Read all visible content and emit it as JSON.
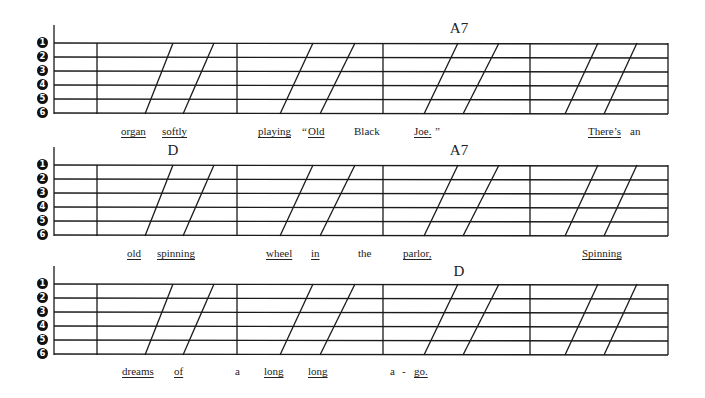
{
  "page": {
    "string_numbers": [
      "1",
      "2",
      "3",
      "4",
      "5",
      "6"
    ],
    "systems": [
      {
        "id": "system-1",
        "top": 0,
        "chords": [
          {
            "label": "A7",
            "x": 459,
            "y": 20
          }
        ],
        "lyrics": [
          {
            "text": "organ",
            "x": 121,
            "y": 125,
            "underline": true
          },
          {
            "text": "softly",
            "x": 162,
            "y": 125,
            "underline": true
          },
          {
            "text": "playing",
            "x": 258,
            "y": 125,
            "underline": true
          },
          {
            "text": "“",
            "x": 302,
            "y": 125,
            "underline": false
          },
          {
            "text": "Old",
            "x": 308,
            "y": 125,
            "underline": true
          },
          {
            "text": "Black",
            "x": 354,
            "y": 125,
            "underline": false
          },
          {
            "text": "Joe.",
            "x": 414,
            "y": 125,
            "underline": true
          },
          {
            "text": "”",
            "x": 435,
            "y": 125,
            "underline": false
          },
          {
            "text": "There’s",
            "x": 588,
            "y": 125,
            "underline": true
          },
          {
            "text": "an",
            "x": 630,
            "y": 125,
            "underline": false
          }
        ]
      },
      {
        "id": "system-2",
        "top": 122,
        "chords": [
          {
            "label": "D",
            "x": 173,
            "y": 20
          },
          {
            "label": "A7",
            "x": 459,
            "y": 20
          }
        ],
        "lyrics": [
          {
            "text": "old",
            "x": 127,
            "y": 125,
            "underline": true
          },
          {
            "text": "spinning",
            "x": 157,
            "y": 125,
            "underline": true
          },
          {
            "text": "wheel",
            "x": 266,
            "y": 125,
            "underline": true
          },
          {
            "text": "in",
            "x": 311,
            "y": 125,
            "underline": true
          },
          {
            "text": "the",
            "x": 358,
            "y": 125,
            "underline": false
          },
          {
            "text": "parlor,",
            "x": 403,
            "y": 125,
            "underline": true
          },
          {
            "text": "Spinning",
            "x": 582,
            "y": 125,
            "underline": true
          }
        ]
      },
      {
        "id": "system-3",
        "top": 241,
        "chords": [
          {
            "label": "D",
            "x": 459,
            "y": 22
          }
        ],
        "lyrics": [
          {
            "text": "dreams",
            "x": 122,
            "y": 124,
            "underline": true
          },
          {
            "text": "of",
            "x": 174,
            "y": 124,
            "underline": true
          },
          {
            "text": "a",
            "x": 235,
            "y": 124,
            "underline": false
          },
          {
            "text": "long",
            "x": 264,
            "y": 124,
            "underline": true
          },
          {
            "text": "long",
            "x": 308,
            "y": 124,
            "underline": true
          },
          {
            "text": "a",
            "x": 390,
            "y": 124,
            "underline": false
          },
          {
            "text": "-",
            "x": 402,
            "y": 124,
            "underline": false
          },
          {
            "text": "go.",
            "x": 414,
            "y": 124,
            "underline": true
          }
        ]
      }
    ],
    "staff": {
      "left_x": 54,
      "right_x": 668,
      "barlines_x": [
        97,
        237,
        383,
        530
      ],
      "line_offsets": [
        43,
        57,
        71,
        85,
        99,
        113
      ],
      "slashes": [
        [
          173,
          145
        ],
        [
          214,
          183
        ],
        [
          313,
          280
        ],
        [
          355,
          320
        ],
        [
          458,
          424
        ],
        [
          499,
          463
        ],
        [
          598,
          565
        ],
        [
          637,
          604
        ]
      ]
    }
  }
}
